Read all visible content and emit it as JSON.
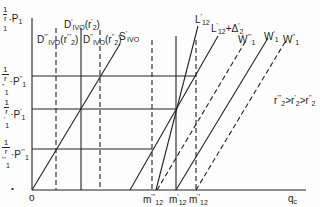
{
  "diagram": {
    "axes": {
      "x_label": "q",
      "x_label_sub": "c",
      "origin_label": "o",
      "y_labels": [
        {
          "id": "top",
          "num": "1",
          "den": "r",
          "den_sub": "1",
          "p": "P",
          "p_sub": "1",
          "p_sup": ""
        },
        {
          "id": "p1_double",
          "num": "1",
          "den": "r",
          "den_sub": "1",
          "den_sup": "''",
          "p": "P",
          "p_sub": "1",
          "p_sup": "''"
        },
        {
          "id": "p1_single",
          "num": "1",
          "den": "r",
          "den_sub": "1",
          "den_sup": "'",
          "p": "P",
          "p_sub": "1",
          "p_sup": "'"
        },
        {
          "id": "p1_triple",
          "num": "1",
          "den": "r",
          "den_sub": "1",
          "den_sup": "'''",
          "p": "P",
          "p_sub": "1",
          "p_sup": "'''"
        }
      ]
    },
    "curves": {
      "d_triple": {
        "main": "D",
        "sup": "'''",
        "sub": "IVO",
        "arg": "(r",
        "arg_sub": "2",
        "arg_sup": "'''",
        "close": ")"
      },
      "d_single": {
        "main": "D",
        "sup": "'",
        "sub": "IVO",
        "arg": "(r",
        "arg_sub": "2",
        "arg_sup": "'",
        "close": ")"
      },
      "d_double": {
        "main": "D",
        "sup": "''",
        "sub": "IVO",
        "arg": "(r",
        "arg_sub": "2",
        "arg_sup": "''",
        "close": ")"
      },
      "s": {
        "main": "S",
        "sup": "'",
        "sub": "IVO"
      },
      "l12": {
        "main": "L",
        "sup": "'",
        "sub": "12"
      },
      "l12_delta": {
        "main": "L",
        "sup": "'",
        "sub": "12",
        "plus": "+Δ",
        "plus_sup": "'",
        "plus_sub": "2"
      },
      "w_triple": {
        "main": "W",
        "sup": "'''",
        "sub": "1"
      },
      "w_single": {
        "main": "W",
        "sup": "'",
        "sub": "1"
      },
      "w_double": {
        "main": "W",
        "sup": "''",
        "sub": "1"
      }
    },
    "m_labels": [
      {
        "main": "m",
        "sup": "'''",
        "sub": "12"
      },
      {
        "main": "m",
        "sup": "'",
        "sub": "12"
      },
      {
        "main": "m",
        "sup": "''",
        "sub": "12"
      }
    ],
    "inequality": {
      "a": "r",
      "a_sub": "2",
      "a_sup": "'''",
      "op1": ">",
      "b": "r",
      "b_sub": "2",
      "b_sup": "'",
      "op2": ">",
      "c": "r",
      "c_sub": "2",
      "c_sup": "''"
    },
    "bullet": "•",
    "colors": {
      "ink": "#222222",
      "background": "#fdfdfd"
    }
  }
}
